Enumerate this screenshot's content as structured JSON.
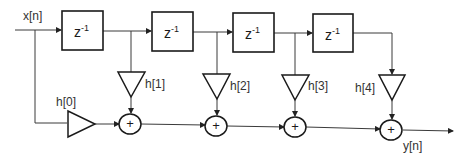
{
  "diagram": {
    "type": "FIR filter (direct form, transversal)",
    "input_label": "x[n]",
    "output_label": "y[n]",
    "delay_blocks": [
      {
        "base": "z",
        "exp": "-1"
      },
      {
        "base": "z",
        "exp": "-1"
      },
      {
        "base": "z",
        "exp": "-1"
      },
      {
        "base": "z",
        "exp": "-1"
      }
    ],
    "coefficients": [
      "h[0]",
      "h[1]",
      "h[2]",
      "h[3]",
      "h[4]"
    ],
    "adder_symbol": "+",
    "colors": {
      "line": "#3a3a3a",
      "stroke": "#1a1a1a",
      "background": "#ffffff"
    }
  }
}
